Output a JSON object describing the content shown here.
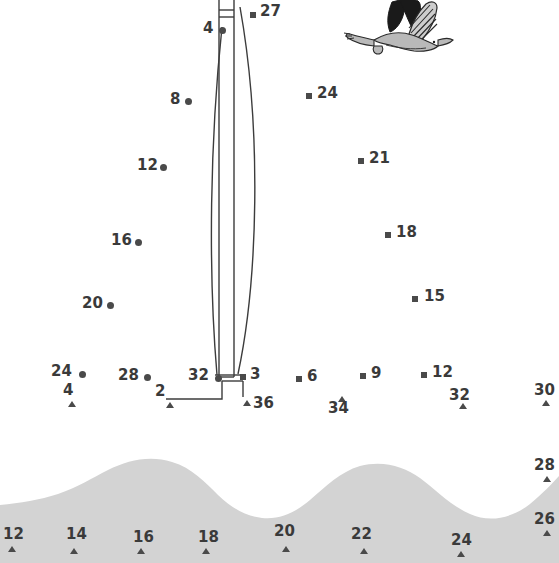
{
  "page": {
    "background_color": "#ffffff",
    "marker_color": "#4a4a4a",
    "label_color": "#3a3a3a",
    "wave_color": "#d3d3d3",
    "line_color": "#3c3c3c"
  },
  "water": {
    "name": "wave-silhouette",
    "color": "#d3d3d3"
  },
  "bird": {
    "name": "seagull-illustration",
    "body_color": "#b9b9b9",
    "wing_color": "#1a1a1a"
  },
  "boat": {
    "name": "partial-sailboat-outline",
    "stroke": "#3c3c3c"
  },
  "markers": [
    {
      "id": "dot-27",
      "label": "27",
      "shape": "square",
      "mx": 250,
      "my": 12,
      "lx": 260,
      "ly": 4
    },
    {
      "id": "dot-4",
      "label": "4",
      "shape": "circle",
      "mx": 219,
      "my": 27,
      "lx": 203,
      "ly": 21
    },
    {
      "id": "dot-24t",
      "label": "24",
      "shape": "square",
      "mx": 306,
      "my": 93,
      "lx": 317,
      "ly": 86
    },
    {
      "id": "dot-8",
      "label": "8",
      "shape": "circle",
      "mx": 185,
      "my": 98,
      "lx": 170,
      "ly": 92
    },
    {
      "id": "dot-21",
      "label": "21",
      "shape": "square",
      "mx": 358,
      "my": 158,
      "lx": 369,
      "ly": 151
    },
    {
      "id": "dot-12l",
      "label": "12",
      "shape": "circle",
      "mx": 160,
      "my": 164,
      "lx": 137,
      "ly": 158
    },
    {
      "id": "dot-18",
      "label": "18",
      "shape": "square",
      "mx": 385,
      "my": 232,
      "lx": 396,
      "ly": 225
    },
    {
      "id": "dot-16l",
      "label": "16",
      "shape": "circle",
      "mx": 135,
      "my": 239,
      "lx": 111,
      "ly": 233
    },
    {
      "id": "dot-15",
      "label": "15",
      "shape": "square",
      "mx": 412,
      "my": 296,
      "lx": 424,
      "ly": 289
    },
    {
      "id": "dot-20l",
      "label": "20",
      "shape": "circle",
      "mx": 107,
      "my": 302,
      "lx": 82,
      "ly": 296
    },
    {
      "id": "dot-24b",
      "label": "24",
      "shape": "circle",
      "mx": 79,
      "my": 371,
      "lx": 51,
      "ly": 364
    },
    {
      "id": "dot-28b",
      "label": "28",
      "shape": "circle",
      "mx": 144,
      "my": 374,
      "lx": 118,
      "ly": 368
    },
    {
      "id": "dot-32b",
      "label": "32",
      "shape": "circle",
      "mx": 215,
      "my": 375,
      "lx": 188,
      "ly": 368
    },
    {
      "id": "dot-3",
      "label": "3",
      "shape": "square",
      "mx": 240,
      "my": 374,
      "lx": 250,
      "ly": 367
    },
    {
      "id": "dot-6",
      "label": "6",
      "shape": "square",
      "mx": 296,
      "my": 376,
      "lx": 307,
      "ly": 369
    },
    {
      "id": "dot-9",
      "label": "9",
      "shape": "square",
      "mx": 360,
      "my": 373,
      "lx": 371,
      "ly": 366
    },
    {
      "id": "dot-12r",
      "label": "12",
      "shape": "square",
      "mx": 421,
      "my": 372,
      "lx": 432,
      "ly": 365
    },
    {
      "id": "dot-4t",
      "label": "4",
      "shape": "triangle",
      "mx": 68,
      "my": 401,
      "lx": 63,
      "ly": 383
    },
    {
      "id": "dot-2",
      "label": "2",
      "shape": "triangle",
      "mx": 166,
      "my": 402,
      "lx": 155,
      "ly": 384
    },
    {
      "id": "dot-36",
      "label": "36",
      "shape": "triangle",
      "mx": 243,
      "my": 400,
      "lx": 253,
      "ly": 396
    },
    {
      "id": "dot-34",
      "label": "34",
      "shape": "triangle",
      "mx": 338,
      "my": 396,
      "lx": 328,
      "ly": 401
    },
    {
      "id": "dot-32r",
      "label": "32",
      "shape": "triangle",
      "mx": 459,
      "my": 403,
      "lx": 449,
      "ly": 388
    },
    {
      "id": "dot-30r",
      "label": "30",
      "shape": "triangle",
      "mx": 542,
      "my": 400,
      "lx": 534,
      "ly": 383
    },
    {
      "id": "dot-28r",
      "label": "28",
      "shape": "triangle",
      "mx": 543,
      "my": 476,
      "lx": 534,
      "ly": 458
    },
    {
      "id": "dot-26r",
      "label": "26",
      "shape": "triangle",
      "mx": 543,
      "my": 530,
      "lx": 534,
      "ly": 512
    },
    {
      "id": "dot-12w",
      "label": "12",
      "shape": "triangle",
      "mx": 8,
      "my": 546,
      "lx": 3,
      "ly": 527
    },
    {
      "id": "dot-14w",
      "label": "14",
      "shape": "triangle",
      "mx": 70,
      "my": 548,
      "lx": 66,
      "ly": 527
    },
    {
      "id": "dot-16w",
      "label": "16",
      "shape": "triangle",
      "mx": 137,
      "my": 548,
      "lx": 133,
      "ly": 530
    },
    {
      "id": "dot-18w",
      "label": "18",
      "shape": "triangle",
      "mx": 202,
      "my": 548,
      "lx": 198,
      "ly": 530
    },
    {
      "id": "dot-20w",
      "label": "20",
      "shape": "triangle",
      "mx": 282,
      "my": 546,
      "lx": 274,
      "ly": 524
    },
    {
      "id": "dot-22w",
      "label": "22",
      "shape": "triangle",
      "mx": 360,
      "my": 548,
      "lx": 351,
      "ly": 527
    },
    {
      "id": "dot-24w",
      "label": "24",
      "shape": "triangle",
      "mx": 457,
      "my": 551,
      "lx": 451,
      "ly": 533
    }
  ]
}
